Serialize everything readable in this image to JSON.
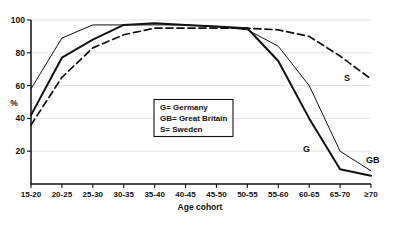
{
  "chart_data": {
    "type": "line",
    "title": "",
    "xlabel": "Age cohort",
    "ylabel": "%",
    "categories": [
      "15-20",
      "20-25",
      "25-30",
      "30-35",
      "35-40",
      "40-45",
      "45-50",
      "50-55",
      "55-60",
      "60-65",
      "65-70",
      "≥70"
    ],
    "ylim": [
      0,
      100
    ],
    "yticks": [
      20,
      40,
      60,
      80,
      100
    ],
    "ytick_labels": [
      "20",
      "40",
      "60",
      "80",
      "100"
    ],
    "grid": true,
    "legend_position": "center",
    "series": [
      {
        "name": "GB",
        "label": "Great Britain",
        "style": "thin-solid",
        "end_label": "GB",
        "values": [
          58,
          89,
          97,
          97,
          97,
          97,
          96,
          94,
          84,
          60,
          20,
          8
        ]
      },
      {
        "name": "G",
        "label": "Germany",
        "style": "thick-solid",
        "end_label": "G",
        "values": [
          42,
          77,
          88,
          97,
          98,
          97,
          96,
          95,
          75,
          40,
          9,
          5
        ]
      },
      {
        "name": "S",
        "label": "Sweden",
        "style": "dashed",
        "end_label": "S",
        "values": [
          36,
          65,
          83,
          91,
          95,
          95,
          95,
          95,
          94,
          90,
          78,
          64
        ]
      }
    ],
    "legend_entries": [
      "G= Germany",
      "GB= Great Britain",
      "S= Sweden"
    ],
    "annotations": [
      {
        "text": "S",
        "series": "S"
      },
      {
        "text": "G",
        "series": "G"
      },
      {
        "text": "GB",
        "series": "GB"
      }
    ]
  },
  "colors": {
    "line": "#111111",
    "grid": "#d9d9d9",
    "background": "#ffffff"
  }
}
